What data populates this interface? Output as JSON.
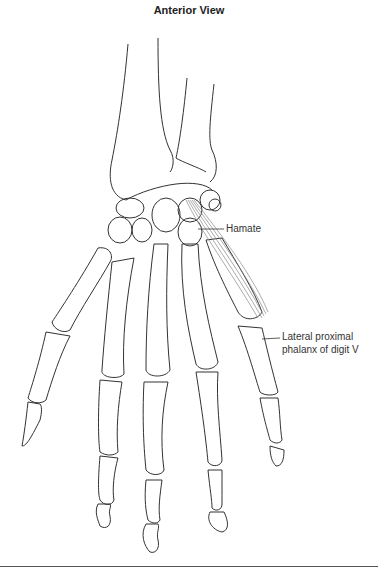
{
  "figure": {
    "title": "Anterior View",
    "labels": {
      "hamate": "Hamate",
      "phalanx_line1": "Lateral proximal",
      "phalanx_line2": "phalanx of digit V"
    },
    "colors": {
      "outline": "#333333",
      "muscle": "#888888"
    }
  }
}
